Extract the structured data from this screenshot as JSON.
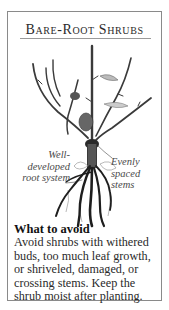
{
  "card": {
    "title": "Bare-Root Shrubs",
    "illustration": {
      "subject": "bare-root-shrub",
      "labels": {
        "left": "Well-developed root system",
        "right": "Evenly spaced stems"
      }
    },
    "avoid": {
      "heading": "What to avoid",
      "body": "Avoid shrubs with withered buds, too much leaf growth, or shriveled, damaged, or crossing stems. Keep the shrub moist after planting."
    }
  }
}
